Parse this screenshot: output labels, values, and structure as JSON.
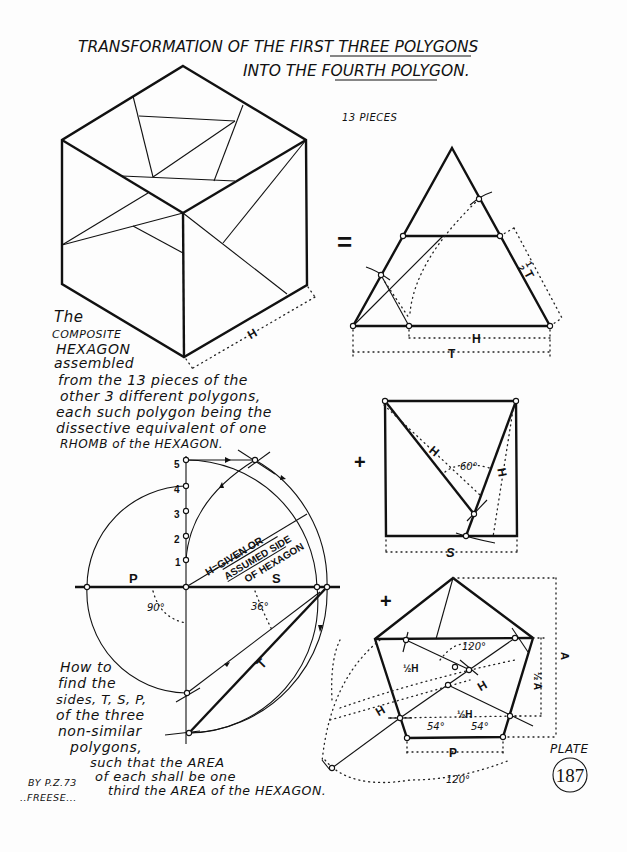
{
  "title": {
    "line1_prefix": "TRANSFORMATION OF THE ",
    "line1_emphasis": "FIRST THREE",
    "line1_suffix": " POLYGONS",
    "line2_prefix": "INTO THE ",
    "line2_emphasis": "FOURTH",
    "line2_suffix": " POLYGON."
  },
  "hexagon": {
    "dimension_label": "H",
    "caption": [
      "The",
      "COMPOSITE",
      "HEXAGON",
      "assembled",
      "from the 13 pieces of the",
      "other 3 different polygons,",
      "each such polygon being the",
      "dissective equivalent of one",
      "RHOMB of the HEXAGON."
    ]
  },
  "triangle": {
    "pieces_label": "13 PIECES",
    "equals_sign": "=",
    "side_label": "½ T",
    "half_num": "1",
    "half_den": "2",
    "half_letter": "T",
    "base_inner_label": "H",
    "base_outer_label": "T"
  },
  "square": {
    "plus_sign": "+",
    "diagonal_label": "H",
    "right_label": "H",
    "angle_label": "60°",
    "base_label": "S"
  },
  "construction": {
    "ticks": [
      "5",
      "4",
      "3",
      "2",
      "1"
    ],
    "p_label": "P",
    "s_label": "S",
    "t_label": "T",
    "angle_90": "90°",
    "angle_36": "36°",
    "h_note": [
      "H=GIVEN OR",
      "ASSUMED SIDE",
      "OF HEXAGON"
    ],
    "caption": [
      "How to",
      "find the",
      "sides, T, S, P,",
      "of the three",
      "non-similar",
      "polygons,",
      "such that the AREA",
      "of each shall be one",
      "third the AREA of the HEXAGON."
    ]
  },
  "pentagon": {
    "plus_sign": "+",
    "angle_top": "120°",
    "half_h_1": "½H",
    "half_h_2": "½H",
    "h_inner": "H",
    "h_outer": "H",
    "angle_left": "54°",
    "angle_right": "54°",
    "base_label": "P",
    "angle_bottom": "120°",
    "apothem_label": "A",
    "half_apothem_label": "½ A"
  },
  "plate": {
    "label": "PLATE",
    "number": "187"
  },
  "credit": {
    "line1": "BY P.Z.73",
    "line2": "..FREESE..."
  }
}
